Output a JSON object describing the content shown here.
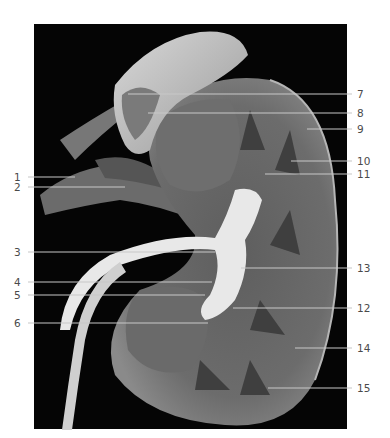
{
  "figure": {
    "background": "#ffffff",
    "photo_background": "#050505",
    "label_color": "#4a4a4a",
    "leader_color": "#c8c8c8"
  },
  "labels": {
    "left": [
      {
        "n": "1",
        "y": 177,
        "x_end": 75
      },
      {
        "n": "2",
        "y": 187,
        "x_end": 125
      },
      {
        "n": "3",
        "y": 252,
        "x_end": 215
      },
      {
        "n": "4",
        "y": 282,
        "x_end": 212
      },
      {
        "n": "5",
        "y": 295,
        "x_end": 205
      },
      {
        "n": "6",
        "y": 323,
        "x_end": 208
      }
    ],
    "right": [
      {
        "n": "7",
        "y": 94,
        "x_start": 128
      },
      {
        "n": "8",
        "y": 113,
        "x_start": 148
      },
      {
        "n": "9",
        "y": 129,
        "x_start": 307
      },
      {
        "n": "10",
        "y": 161,
        "x_start": 291
      },
      {
        "n": "11",
        "y": 174,
        "x_start": 265
      },
      {
        "n": "13",
        "y": 268,
        "x_start": 241
      },
      {
        "n": "12",
        "y": 308,
        "x_start": 233
      },
      {
        "n": "14",
        "y": 348,
        "x_start": 295
      },
      {
        "n": "15",
        "y": 388,
        "x_start": 268
      }
    ]
  }
}
